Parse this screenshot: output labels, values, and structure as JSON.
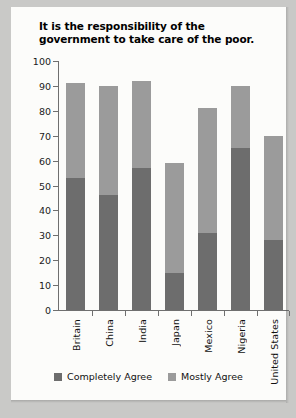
{
  "chart_data": {
    "type": "bar",
    "subtype": "stacked-bar",
    "title": "It is the responsibility of the government to take care of the poor.",
    "xlabel": "",
    "ylabel": "",
    "ylim": [
      0,
      100
    ],
    "ytick_step": 10,
    "yticks": [
      100,
      90,
      80,
      70,
      60,
      50,
      40,
      30,
      20,
      10,
      0
    ],
    "grid": false,
    "legend_position": "bottom-center",
    "categories": [
      "Britain",
      "China",
      "India",
      "Japan",
      "Mexico",
      "Nigeria",
      "United States"
    ],
    "series": [
      {
        "name": "Completely Agree",
        "color": "#6d6d6d",
        "values": [
          53,
          46,
          57,
          15,
          31,
          65,
          28
        ]
      },
      {
        "name": "Mostly Agree",
        "color": "#9b9b9b",
        "values": [
          38,
          44,
          35,
          44,
          50,
          25,
          42
        ]
      }
    ],
    "totals": [
      91,
      90,
      92,
      59,
      81,
      90,
      70
    ],
    "colors": {
      "axis": "#6f6f6f",
      "card_background": "#fcfcfa",
      "page_background": "#c9c9c7",
      "text": "#111111"
    }
  },
  "legend": {
    "items": [
      {
        "label": "Completely Agree",
        "color": "#6d6d6d"
      },
      {
        "label": "Mostly Agree",
        "color": "#9b9b9b"
      }
    ]
  }
}
